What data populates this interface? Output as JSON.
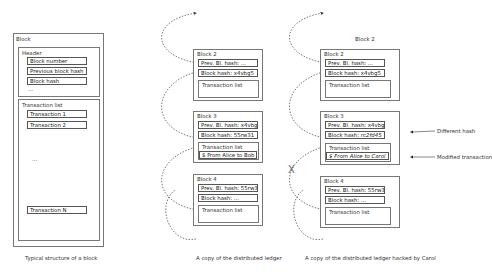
{
  "structure": {
    "title": "Block",
    "header": {
      "title": "Header",
      "fields": [
        "Block number",
        "Previous block hash",
        "Block hash"
      ],
      "ellipsis": "..."
    },
    "transactions": {
      "title": "Transaction list",
      "items": [
        "Transaction 1",
        "Transaction 2"
      ],
      "ellipsis": "...",
      "last": "Transaction N"
    },
    "caption": "Typical structure of a block"
  },
  "ledger": {
    "caption": "A copy of the distributed ledger",
    "blocks": [
      {
        "title": "Block 2",
        "prev_hash": "Prev. Bl. hash: ...",
        "block_hash": "Block hash: x4vbg5",
        "tx_title": "Transaction list",
        "tx": ""
      },
      {
        "title": "Block 3",
        "prev_hash": "Prev. Bl. hash: x4vbg5",
        "block_hash": "Block hash: 55rw31",
        "tx_title": "Transaction list",
        "tx": "$ From Alice to Bob"
      },
      {
        "title": "Block 4",
        "prev_hash": "Prev. Bl. hash: 55rw31",
        "block_hash": "Block hash: ...",
        "tx_title": "Transaction list",
        "tx": ""
      }
    ]
  },
  "hacked": {
    "caption": "A copy of the distributed ledger hacked by Carol",
    "top_label": "Block 2",
    "blocks": [
      {
        "title": "Block 2",
        "prev_hash": "Prev. Bl. hash: ...",
        "block_hash": "Block hash: x4vbg5",
        "tx_title": "Transaction list",
        "tx": ""
      },
      {
        "title": "Block 3",
        "prev_hash": "Prev. Bl. hash: x4vbg5",
        "block_hash": "Block hash: ",
        "block_hash_mod": "rc2fd45",
        "tx_title": "Transaction list",
        "tx": "$ From Alice to Carol"
      },
      {
        "title": "Block 4",
        "prev_hash": "Prev. Bl. hash: 55rw31",
        "block_hash": "Block hash: ...",
        "tx_title": "Transaction list",
        "tx": ""
      }
    ],
    "broken_link_mark": "X",
    "annotations": {
      "different_hash": "Different hash",
      "modified_transaction": "Modified transaction"
    }
  }
}
